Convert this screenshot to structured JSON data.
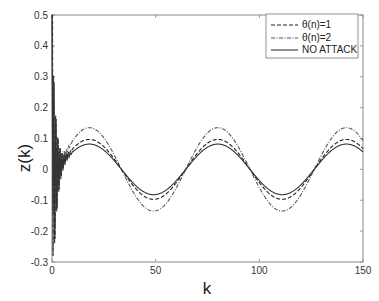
{
  "chart_data": {
    "type": "line",
    "title": "",
    "xlabel": "k",
    "ylabel": "z(k)",
    "xlim": [
      0,
      150
    ],
    "ylim": [
      -0.3,
      0.5
    ],
    "xticks": [
      0,
      50,
      100,
      150
    ],
    "yticks": [
      -0.3,
      -0.2,
      -0.1,
      0,
      0.1,
      0.2,
      0.3,
      0.4,
      0.5
    ],
    "ytick_labels": [
      "-0.3",
      "-0.2",
      "-0.1",
      "0",
      "0.1",
      "0.2",
      "0.3",
      "0.4",
      "0.5"
    ],
    "xtick_labels": [
      "0",
      "50",
      "100",
      "150"
    ],
    "grid": false,
    "legend_position": "upper right",
    "period": 62,
    "phase_peak_k": 80,
    "series": [
      {
        "name": "θ(n)=1",
        "style": "dashed",
        "color": "#222222",
        "amplitude": 0.097,
        "peaks": [
          {
            "k": 18,
            "z": 0.09
          },
          {
            "k": 80,
            "z": 0.097
          },
          {
            "k": 142,
            "z": 0.097
          }
        ],
        "troughs": [
          {
            "k": 49,
            "z": -0.097
          },
          {
            "k": 111,
            "z": -0.097
          }
        ]
      },
      {
        "name": "θ(n)=2",
        "style": "dashdot",
        "color": "#555555",
        "amplitude": 0.135,
        "peaks": [
          {
            "k": 18,
            "z": 0.13
          },
          {
            "k": 80,
            "z": 0.135
          },
          {
            "k": 142,
            "z": 0.135
          }
        ],
        "troughs": [
          {
            "k": 49,
            "z": -0.13
          },
          {
            "k": 111,
            "z": -0.135
          }
        ]
      },
      {
        "name": "NO ATTACK",
        "style": "solid",
        "color": "#333333",
        "amplitude": 0.082,
        "peaks": [
          {
            "k": 18,
            "z": 0.08
          },
          {
            "k": 80,
            "z": 0.082
          },
          {
            "k": 142,
            "z": 0.082
          }
        ],
        "troughs": [
          {
            "k": 49,
            "z": -0.082
          },
          {
            "k": 111,
            "z": -0.082
          }
        ]
      }
    ],
    "transient": {
      "k_range": [
        0,
        8
      ],
      "initial_value": 0.5,
      "min_value": -0.28,
      "description": "large oscillations near k=0 decaying by k≈8"
    }
  },
  "legend": {
    "items": [
      {
        "label": "θ(n)=1",
        "style": "dashed"
      },
      {
        "label": "θ(n)=2",
        "style": "dashdot"
      },
      {
        "label": "NO ATTACK",
        "style": "solid"
      }
    ]
  },
  "axes": {
    "xlabel": "k",
    "ylabel": "z(k)"
  }
}
